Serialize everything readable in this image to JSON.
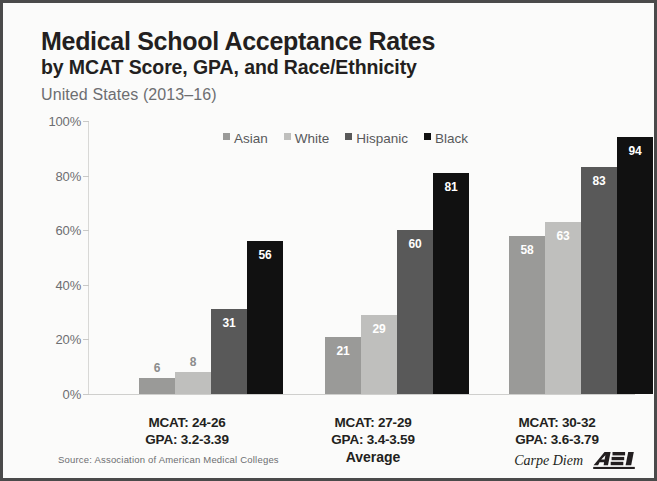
{
  "header": {
    "title_line1": "Medical School Acceptance Rates",
    "title_line2": "by MCAT Score, GPA, and Race/Ethnicity",
    "subtitle": "United States (2013–16)"
  },
  "footer": {
    "source": "Source: Association of American Medical Colleges",
    "brand_text": "Carpe Diem",
    "logo_text": "AEI"
  },
  "colors": {
    "asian": "#9a9a98",
    "white": "#bfbfbd",
    "hispanic": "#595959",
    "black": "#111111",
    "title": "#231f20",
    "subtitle": "#6d6e71",
    "axis": "#6d6e71",
    "border": "#4a4a4a"
  },
  "chart_data": {
    "type": "bar",
    "title": "Medical School Acceptance Rates by MCAT Score, GPA, and Race/Ethnicity",
    "subtitle": "United States (2013–16)",
    "xlabel": "",
    "ylabel": "",
    "ylim": [
      0,
      100
    ],
    "yticks": [
      "0%",
      "20%",
      "40%",
      "60%",
      "80%",
      "100%"
    ],
    "ytick_values": [
      0,
      20,
      40,
      60,
      80,
      100
    ],
    "grid": false,
    "legend_position": "top-center",
    "categories": [
      "MCAT: 24-26 / GPA: 3.2-3.39",
      "MCAT: 27-29 / GPA: 3.4-3.59",
      "MCAT: 30-32 / GPA: 3.6-3.79"
    ],
    "category_labels": [
      {
        "line1": "MCAT: 24-26",
        "line2": "GPA: 3.2-3.39",
        "note": ""
      },
      {
        "line1": "MCAT: 27-29",
        "line2": "GPA: 3.4-3.59",
        "note": "Average"
      },
      {
        "line1": "MCAT: 30-32",
        "line2": "GPA: 3.6-3.79",
        "note": ""
      }
    ],
    "series": [
      {
        "name": "Asian",
        "color": "#9a9a98",
        "values": [
          6,
          21,
          58
        ]
      },
      {
        "name": "White",
        "color": "#bfbfbd",
        "values": [
          8,
          29,
          63
        ]
      },
      {
        "name": "Hispanic",
        "color": "#595959",
        "values": [
          31,
          60,
          83
        ]
      },
      {
        "name": "Black",
        "color": "#111111",
        "values": [
          56,
          81,
          94
        ]
      }
    ],
    "value_unit": "percent",
    "source": "Association of American Medical Colleges"
  }
}
